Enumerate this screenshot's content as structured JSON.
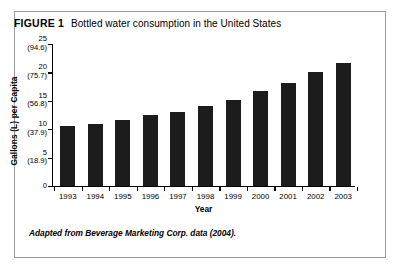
{
  "figure": {
    "label": "FIGURE 1",
    "title": "Bottled water consumption in the United States",
    "source_note": "Adapted from Beverage Marketing Corp. data (2004)."
  },
  "chart_data": {
    "type": "bar",
    "title": "Bottled water consumption in the United States",
    "xlabel": "Year",
    "ylabel": "Gallons (L) per Capita",
    "categories": [
      "1993",
      "1994",
      "1995",
      "1996",
      "1997",
      "1998",
      "1999",
      "2000",
      "2001",
      "2002",
      "2003"
    ],
    "values": [
      10.5,
      10.9,
      11.6,
      12.5,
      13.1,
      14.1,
      15.2,
      16.7,
      18.2,
      20.1,
      21.6
    ],
    "ylim": [
      0,
      25
    ],
    "yticks": [
      0,
      5,
      10,
      15,
      20,
      25
    ],
    "ytick_labels": [
      {
        "gallons": "25",
        "liters": "(94.6)"
      },
      {
        "gallons": "20",
        "liters": "(75.7)"
      },
      {
        "gallons": "15",
        "liters": "(56.8)"
      },
      {
        "gallons": "10",
        "liters": "(37.9)"
      },
      {
        "gallons": "5",
        "liters": "(18.9)"
      },
      {
        "gallons": "0",
        "liters": ""
      }
    ],
    "grid": false,
    "legend": "none",
    "bar_color": "#1c1c1c",
    "axis_color": "#000000"
  }
}
